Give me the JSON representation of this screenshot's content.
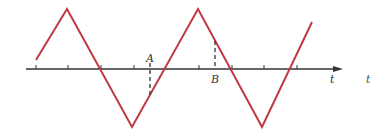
{
  "diagram": {
    "colors": {
      "wave": "#c0393f",
      "axis": "#333333",
      "marker": "#333333",
      "background": "#ffffff"
    },
    "axis": {
      "label": "t",
      "extra_label": "t"
    },
    "markers": {
      "a_label": "A",
      "b_label": "B"
    }
  }
}
